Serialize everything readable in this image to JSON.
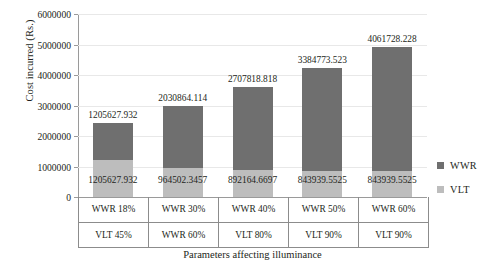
{
  "chart_data": {
    "type": "bar",
    "subtype": "stacked-vertical",
    "title": "",
    "xlabel": "Parameters affecting illuminance",
    "ylabel": "Cost incurred (Rs.)",
    "ylim": [
      0,
      6000000
    ],
    "ytick_step": 1000000,
    "ytick_labels": [
      "0",
      "1000000",
      "2000000",
      "3000000",
      "4000000",
      "5000000",
      "6000000"
    ],
    "ytick_values": [
      0,
      1000000,
      2000000,
      3000000,
      4000000,
      5000000,
      6000000
    ],
    "grid": true,
    "grid_axis": "y",
    "legend_position": "right",
    "categories": [
      "WWR 18%",
      "WWR 30%",
      "WWR 40%",
      "WWR 50%",
      "WWR 60%"
    ],
    "category_sublabels": [
      "VLT 45%",
      "WWR 60%",
      "VLT 80%",
      "VLT 90%",
      "VLT 90%"
    ],
    "series": [
      {
        "name": "VLT",
        "color": "#bdbdbd",
        "values": [
          1205627.932,
          964502.3457,
          892164.6697,
          843939.5525,
          843939.5525
        ],
        "labels": [
          "1205627.932",
          "964502.3457",
          "892164.6697",
          "843939.5525",
          "843939.5525"
        ]
      },
      {
        "name": "WWR",
        "color": "#6f6f6f",
        "values": [
          1205627.932,
          2030864.114,
          2707818.818,
          3384773.523,
          4061728.228
        ],
        "labels": [
          "1205627.932",
          "2030864.114",
          "2707818.818",
          "3384773.523",
          "4061728.228"
        ]
      }
    ],
    "bar_totals": [
      2411255.864,
      2995366.46,
      3599983.488,
      4228713.075,
      4905667.78
    ]
  },
  "legend": {
    "items": [
      {
        "label": "WWR",
        "color": "#6f6f6f",
        "swatch_name": "legend-swatch-wwr"
      },
      {
        "label": "VLT",
        "color": "#bdbdbd",
        "swatch_name": "legend-swatch-vlt"
      }
    ]
  },
  "colors": {
    "wwr": "#6f6f6f",
    "vlt": "#bdbdbd",
    "axis": "#9a9a9a",
    "grid": "#e8e8e8",
    "text": "#231f20",
    "table_border": "#8c8c8c"
  }
}
